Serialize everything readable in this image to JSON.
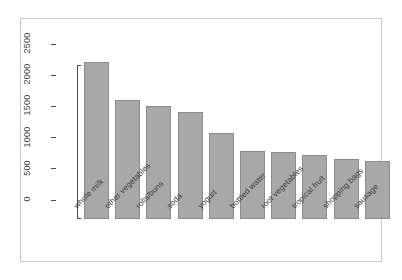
{
  "chart_data": {
    "type": "bar",
    "title": "",
    "subtitle": "",
    "xlabel": "",
    "ylabel": "",
    "categories": [
      "whole milk",
      "other vegetables",
      "rolls/buns",
      "soda",
      "yogurt",
      "bottled water",
      "root vegetables",
      "tropical fruit",
      "shopping bags",
      "sausage"
    ],
    "values": [
      2513,
      1903,
      1809,
      1715,
      1372,
      1087,
      1072,
      1032,
      969,
      924
    ],
    "ylim": [
      0,
      2500
    ],
    "yticks": [
      0,
      500,
      1000,
      1500,
      2000,
      2500
    ],
    "ytick_labels": [
      "0",
      "500",
      "1000",
      "1500",
      "2000",
      "2500"
    ],
    "grid": false,
    "legend": false,
    "legend_position": "none",
    "bar_fill": "#a8a8a8",
    "bar_border": "#8c8c8c",
    "axis_color": "#4d4d4d",
    "frame_color": "#c9c9c9",
    "background": "#ffffff",
    "xtick_rotation_degrees": -45,
    "ytick_rotation_degrees": -90
  }
}
